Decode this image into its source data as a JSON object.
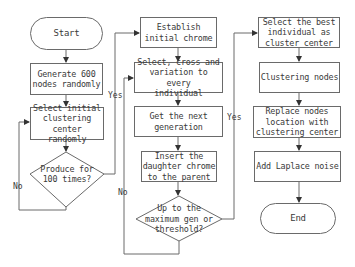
{
  "diagram": {
    "type": "flowchart",
    "colors": {
      "stroke": "#6a6a6a",
      "text": "#3a3a3a",
      "background": "#ffffff"
    },
    "nodes": {
      "start": "Start",
      "generate": "Generate 600\nnodes randomly",
      "select_initial": "Select initial\nclustering\ncenter randomly",
      "produce_decision": "Produce for\n100 times?",
      "establish": "Establish\ninitial chrome",
      "select_cross": "Select, cross and\nvariation to every\nindividual",
      "next_gen": "Get the next\ngeneration",
      "insert": "Insert the\ndaughter chrome\nto the parent",
      "max_decision": "Up to the\nmaximum gen or\nthreshold?",
      "select_best": "Select the best\nindividual as\ncluster center",
      "clustering": "Clustering nodes",
      "replace": "Replace nodes\nlocation with\nclustering center",
      "laplace": "Add Laplace noise",
      "end": "End"
    },
    "edge_labels": {
      "produce_no": "No",
      "produce_yes": "Yes",
      "max_no": "No",
      "max_yes": "Yes"
    }
  }
}
